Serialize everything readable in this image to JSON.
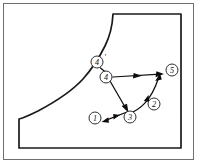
{
  "figure": {
    "type": "technical-line-diagram",
    "title": "",
    "background_color": "#ffffff",
    "frame": {
      "stroke_color": "#6e6e73",
      "left": 3,
      "top": 3,
      "width": 191,
      "height": 157
    },
    "outline": {
      "name": "curved-body-outline",
      "stroke_color": "#1a1a1a",
      "description": "Closed region bounded below by a horizontal base, on the right by a vertical wall, on the top-right by a horizontal ledge, and on the upper-left by a concave curve descending to a short vertical left face."
    },
    "curve_points": [
      {
        "x": 19,
        "y": 148
      },
      {
        "x": 19,
        "y": 117
      },
      {
        "x": 40,
        "y": 108
      },
      {
        "x": 62,
        "y": 95
      },
      {
        "x": 80,
        "y": 80
      },
      {
        "x": 94,
        "y": 62
      },
      {
        "x": 105,
        "y": 42
      },
      {
        "x": 112,
        "y": 22
      },
      {
        "x": 113,
        "y": 14
      }
    ],
    "stations": [
      {
        "id": "station-1",
        "label": "1",
        "prime": "",
        "cx": 95,
        "cy": 118,
        "r": 6.0
      },
      {
        "id": "station-2",
        "label": "2",
        "prime": "",
        "cx": 154,
        "cy": 104,
        "r": 6.0
      },
      {
        "id": "station-3",
        "label": "3",
        "prime": "",
        "cx": 130,
        "cy": 117,
        "r": 6.0
      },
      {
        "id": "station-4",
        "label": "4",
        "prime": "",
        "cx": 106,
        "cy": 77,
        "r": 6.0
      },
      {
        "id": "station-4-prime",
        "label": "4",
        "prime": "'",
        "cx": 97,
        "cy": 62,
        "r": 6.0
      },
      {
        "id": "station-5",
        "label": "5",
        "prime": "",
        "cx": 172,
        "cy": 70,
        "r": 6.0
      }
    ],
    "vectors": [
      {
        "id": "vector-4-to-5",
        "name": "arrow-4-to-5",
        "from": "4",
        "to": "5",
        "path": "M 113 77 L 162 74",
        "head_at": {
          "x": 162,
          "y": 74
        },
        "head_angle": -3.5,
        "style": "straight"
      },
      {
        "id": "vector-4-to-3",
        "name": "arrow-4-to-3",
        "from": "4",
        "to": "3",
        "path": "M 110 81 L 127 110",
        "head_at": {
          "x": 127,
          "y": 110
        },
        "head_angle": 59.6,
        "style": "straight"
      },
      {
        "id": "vector-3-to-1",
        "name": "arrow-3-to-1",
        "from": "3",
        "to": "1",
        "path": "M 126 112 L 103 121",
        "head_at": {
          "x": 103,
          "y": 121
        },
        "head_angle": 158.6,
        "style": "straight"
      },
      {
        "id": "vector-3-to-5",
        "name": "arrow-3-to-5",
        "from": "3",
        "to": "5",
        "path": "M 127 114 Q 146 108 160 76",
        "head_at": {
          "x": 161,
          "y": 74
        },
        "head_angle": -62.0,
        "style": "curved"
      },
      {
        "id": "vector-4prime-to-4",
        "name": "connector-4prime-to-4",
        "from": "4'",
        "to": "4",
        "path": "M 100 68 L 110 76",
        "head_at": null,
        "head_angle": 0,
        "style": "straight"
      }
    ],
    "colors": {
      "outline": "#1a1a1a",
      "frame": "#6e6e73",
      "vector": "#0d0d0d",
      "background": "#ffffff"
    }
  }
}
